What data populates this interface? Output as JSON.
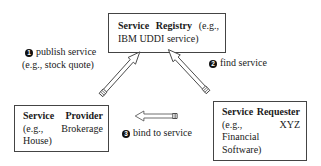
{
  "diagram": {
    "type": "soa-triangle",
    "nodes": {
      "registry": {
        "title": "Service Registry",
        "detail": "(e.g., IBM UDDI service)"
      },
      "provider": {
        "title": "Service Provider",
        "detail": "(e.g., Brokerage House)"
      },
      "requester": {
        "title": "Service Requester",
        "detail": "(e.g., XYZ Financial Software)"
      }
    },
    "edges": [
      {
        "number": "1",
        "label": "publish service",
        "sublabel": "(e.g., stock quote)",
        "from": "provider",
        "to": "registry"
      },
      {
        "number": "2",
        "label": "find service",
        "from": "requester",
        "to": "registry"
      },
      {
        "number": "3",
        "label": "bind to service",
        "from": "requester",
        "to": "provider"
      }
    ]
  }
}
